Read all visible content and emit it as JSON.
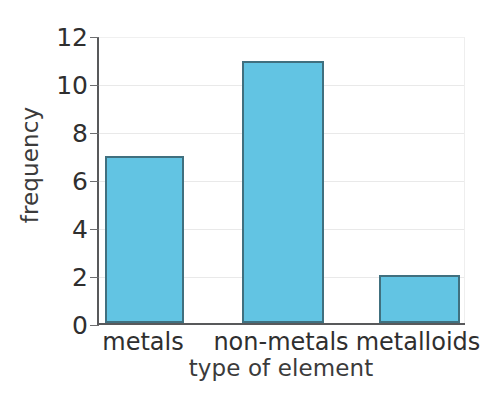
{
  "chart_data": {
    "type": "bar",
    "title": "",
    "subtitle": "",
    "xlabel": "type of element",
    "ylabel": "frequency",
    "categories": [
      "metals",
      "non-metals",
      "metalloids"
    ],
    "values": [
      7,
      11,
      2
    ],
    "ylim": [
      0,
      12
    ],
    "yticks": [
      0,
      2,
      4,
      6,
      8,
      10,
      12
    ],
    "ytick_labels": [
      "0",
      "2",
      "4",
      "6",
      "8",
      "10",
      "12"
    ],
    "grid": "horizontal",
    "legend": "none",
    "annotations": [],
    "colors": {
      "bar_fill": "#62c4e3",
      "bar_edge": "#40707f",
      "axis": "#58595b",
      "grid": "#e9e9e9",
      "text": "#2f2f2f",
      "background": "#ffffff"
    }
  }
}
